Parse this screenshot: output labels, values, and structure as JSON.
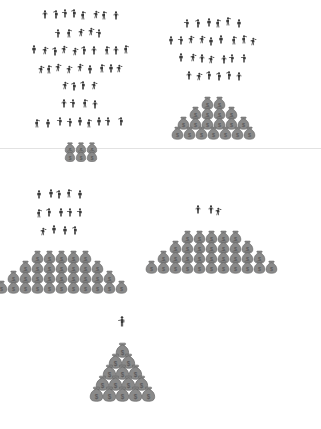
{
  "figure": {
    "background_color": "#ffffff",
    "divider_color": "#e2e2e2",
    "person_color": "#3a3a3a",
    "bag_color": "#8a8a8a",
    "bag_outline_color": "#5d5d5d",
    "bag_symbol": "$"
  },
  "divider": {
    "y": 148
  },
  "groups": [
    {
      "id": "top-left",
      "name": "largest-crowd-smallest-pile",
      "position": {
        "x": 30,
        "y": 6
      },
      "people_count": 45,
      "people_label": "many people",
      "crowd_rows": [
        8,
        5,
        10,
        9,
        4,
        4,
        9
      ],
      "pile_label": "small money cluster",
      "pile_rows": [
        3,
        3
      ],
      "bag_size": 12,
      "bag_count": 6
    },
    {
      "id": "top-right",
      "name": "large-crowd-medium-pile",
      "position": {
        "x": 168,
        "y": 14
      },
      "people_count": 28,
      "people_label": "fewer people",
      "crowd_rows": [
        6,
        9,
        7,
        6
      ],
      "pile_label": "medium money pyramid",
      "pile_rows": [
        2,
        4,
        6,
        7
      ],
      "bag_size": 13,
      "bag_count": 19
    },
    {
      "id": "mid-left",
      "name": "small-crowd-large-pile",
      "position": {
        "x": 36,
        "y": 186
      },
      "people_count": 14,
      "people_label": "a small group",
      "crowd_rows": [
        5,
        5,
        4
      ],
      "pile_label": "large money pyramid",
      "pile_rows": [
        5,
        7,
        9,
        11
      ],
      "bag_size": 13,
      "bag_count": 32
    },
    {
      "id": "mid-right",
      "name": "tiny-crowd-large-pile",
      "position": {
        "x": 196,
        "y": 202
      },
      "people_count": 3,
      "people_label": "three people",
      "crowd_rows": [
        3
      ],
      "pile_label": "large money pyramid",
      "pile_rows": [
        5,
        7,
        9,
        11
      ],
      "bag_size": 13,
      "bag_count": 32
    },
    {
      "id": "bottom-center",
      "name": "single-person-tall-pile",
      "position": {
        "x": 116,
        "y": 310
      },
      "people_count": 1,
      "people_label": "one person",
      "crowd_rows": [
        1
      ],
      "pile_label": "tall money stack",
      "pile_rows": [
        1,
        2,
        3,
        4,
        5
      ],
      "bag_size": 15,
      "bag_count": 15
    }
  ]
}
